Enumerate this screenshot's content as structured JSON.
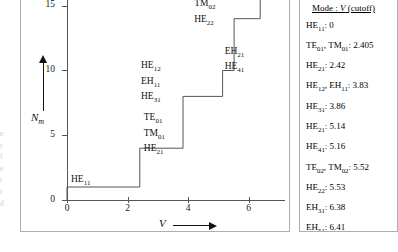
{
  "figure": {
    "edge_text_fragment": "e\nr\nf\ne\nt\nt\nd"
  },
  "chart_data": {
    "type": "line",
    "subtype": "step",
    "title": "",
    "xlabel": "V",
    "ylabel": "N_m",
    "xlim": [
      0,
      7.2
    ],
    "ylim": [
      0,
      16.6
    ],
    "x_ticks": [
      0,
      2,
      4,
      6
    ],
    "x_tick_labels": [
      "0",
      "2",
      "4",
      "6"
    ],
    "y_ticks": [
      0,
      5,
      10,
      15
    ],
    "y_tick_labels": [
      "0",
      "5",
      "10",
      "15"
    ],
    "grid": false,
    "legend_position": "right-box",
    "steps": [
      {
        "x_start": 0.0,
        "x_end": 2.405,
        "y": 1,
        "modes": [
          "HE11"
        ]
      },
      {
        "x_start": 2.405,
        "x_end": 3.83,
        "y": 4,
        "modes": [
          "TE01",
          "TM01",
          "HE21"
        ]
      },
      {
        "x_start": 3.83,
        "x_end": 5.14,
        "y": 8,
        "modes": [
          "HE12",
          "EH11",
          "HE31"
        ]
      },
      {
        "x_start": 5.14,
        "x_end": 5.52,
        "y": 10,
        "modes": [
          "EH21",
          "HE41"
        ]
      },
      {
        "x_start": 5.52,
        "x_end": 6.38,
        "y": 14,
        "modes": [
          "TE02",
          "TM02",
          "HE22"
        ]
      },
      {
        "x_start": 6.38,
        "x_end": 7.2,
        "y": 16,
        "modes": [
          "EH31",
          "HE51"
        ]
      }
    ],
    "step_annotations": [
      {
        "id": "ann-he11",
        "lines": [
          {
            "base": "HE",
            "sub": "11"
          }
        ]
      },
      {
        "id": "ann-step2",
        "lines": [
          {
            "base": "TE",
            "sub": "01"
          },
          {
            "base": "TM",
            "sub": "01"
          },
          {
            "base": "HE",
            "sub": "21"
          }
        ]
      },
      {
        "id": "ann-step3",
        "lines": [
          {
            "base": "HE",
            "sub": "12"
          },
          {
            "base": "EH",
            "sub": "11"
          },
          {
            "base": "HE",
            "sub": "31"
          }
        ]
      },
      {
        "id": "ann-step4",
        "lines": [
          {
            "base": "EH",
            "sub": "21"
          },
          {
            "base": "HE",
            "sub": "41"
          }
        ]
      },
      {
        "id": "ann-step5",
        "lines": [
          {
            "base": "TE",
            "sub": "02"
          },
          {
            "base": "TM",
            "sub": "02"
          },
          {
            "base": "HE",
            "sub": "22"
          }
        ]
      },
      {
        "id": "ann-step6",
        "lines": [
          {
            "base": "EH",
            "sub": "31"
          },
          {
            "base": "HE",
            "sub": "51"
          }
        ]
      }
    ]
  },
  "legend": {
    "title_prefix": "Mode : ",
    "title_var": "V",
    "title_suffix": " (cutoff)",
    "rows": [
      "HEıı: 0",
      "TE₀₁, TM₀₁: 2.405",
      "HE₂₁: 2.42",
      "HE₁₂, EH₁₁: 3.83",
      "HE₃₁: 3.86",
      "HE₂₁: 5.14",
      "HE₄₁: 5.16",
      "TE₀₂, TM₀₂: 5.52",
      "HE₂₂: 5.53",
      "EH₃₁: 6.38",
      "EH₅₁: 6.41"
    ],
    "entries": [
      {
        "modes": [
          {
            "base": "HE",
            "sub": "11"
          }
        ],
        "value": "0"
      },
      {
        "modes": [
          {
            "base": "TE",
            "sub": "01"
          },
          {
            "base": "TM",
            "sub": "01"
          }
        ],
        "value": "2.405"
      },
      {
        "modes": [
          {
            "base": "HE",
            "sub": "21"
          }
        ],
        "value": "2.42"
      },
      {
        "modes": [
          {
            "base": "HE",
            "sub": "12"
          },
          {
            "base": "EH",
            "sub": "11"
          }
        ],
        "value": "3.83"
      },
      {
        "modes": [
          {
            "base": "HE",
            "sub": "31"
          }
        ],
        "value": "3.86"
      },
      {
        "modes": [
          {
            "base": "HE",
            "sub": "21"
          }
        ],
        "value": "5.14"
      },
      {
        "modes": [
          {
            "base": "HE",
            "sub": "41"
          }
        ],
        "value": "5.16"
      },
      {
        "modes": [
          {
            "base": "TE",
            "sub": "02"
          },
          {
            "base": "TM",
            "sub": "02"
          }
        ],
        "value": "5.52"
      },
      {
        "modes": [
          {
            "base": "HE",
            "sub": "22"
          }
        ],
        "value": "5.53"
      },
      {
        "modes": [
          {
            "base": "EH",
            "sub": "31"
          }
        ],
        "value": "6.38"
      },
      {
        "modes": [
          {
            "base": "EH",
            "sub": "51"
          }
        ],
        "value": "6.41"
      }
    ]
  },
  "colors": {
    "line": "#555555",
    "text": "#111111",
    "border": "#aeaeae",
    "background": "#ffffff"
  }
}
